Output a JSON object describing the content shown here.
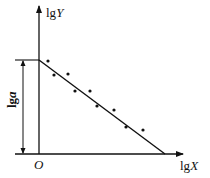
{
  "diagram": {
    "type": "log-log linear regression schematic",
    "y_axis": {
      "label_prefix": "lg",
      "label_var": "Y"
    },
    "x_axis": {
      "label_prefix": "lg",
      "label_var": "X"
    },
    "origin_label": "O",
    "intercept_label": {
      "prefix": "lg",
      "var": "a"
    },
    "regression_line": {
      "from": [
        39,
        60
      ],
      "to": [
        165,
        154
      ]
    },
    "data_points": [
      [
        48,
        61
      ],
      [
        54,
        75
      ],
      [
        68,
        74
      ],
      [
        75,
        91
      ],
      [
        90,
        91
      ],
      [
        97,
        106
      ],
      [
        114,
        110
      ],
      [
        126,
        127
      ],
      [
        143,
        130
      ]
    ],
    "colors": {
      "ink": "#111111",
      "background": "#ffffff"
    }
  }
}
